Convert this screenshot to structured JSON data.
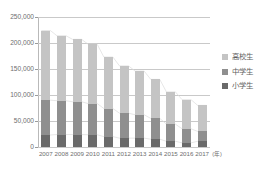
{
  "chart_data": {
    "type": "bar",
    "stacked": true,
    "title": "",
    "xlabel": "(年)",
    "ylabel": "",
    "ylim": [
      0,
      250000
    ],
    "ytick_labels": [
      "250,000",
      "200,000",
      "150,000",
      "100,000",
      "50,000",
      "0"
    ],
    "ytick_values": [
      250000,
      200000,
      150000,
      100000,
      50000,
      0
    ],
    "grid": true,
    "legend_position": "right",
    "categories": [
      "2007",
      "2008",
      "2009",
      "2010",
      "2011",
      "2012",
      "2013",
      "2014",
      "2015",
      "2016",
      "2017"
    ],
    "series": [
      {
        "name": "小学生",
        "color": "#6a6a6a",
        "values": [
          23000,
          24000,
          24000,
          23500,
          20000,
          17000,
          17000,
          15000,
          11000,
          8000,
          11000
        ]
      },
      {
        "name": "中学生",
        "color": "#8f8f8f",
        "values": [
          67000,
          65000,
          63000,
          60000,
          54000,
          48000,
          45000,
          40000,
          33000,
          27000,
          19000
        ]
      },
      {
        "name": "高校生",
        "color": "#c4c4c4",
        "values": [
          134000,
          125000,
          120000,
          114000,
          99000,
          91000,
          84000,
          75000,
          62000,
          56000,
          50000
        ]
      }
    ],
    "totals": [
      224000,
      214000,
      207000,
      197500,
      173000,
      156000,
      146000,
      130000,
      106000,
      91000,
      80000
    ]
  },
  "legend": {
    "items": [
      {
        "label": "高校生",
        "color": "#c4c4c4"
      },
      {
        "label": "中学生",
        "color": "#8f8f8f"
      },
      {
        "label": "小学生",
        "color": "#6a6a6a"
      }
    ]
  },
  "axis": {
    "x_unit": "(年)"
  }
}
